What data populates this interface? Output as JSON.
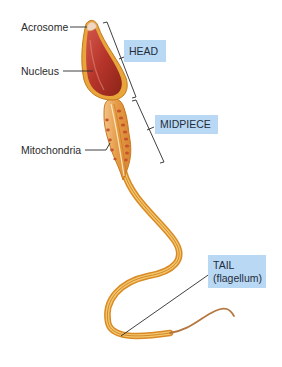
{
  "diagram": {
    "labels": {
      "acrosome": "Acrosome",
      "nucleus": "Nucleus",
      "mitochondria": "Mitochondria"
    },
    "regions": {
      "head": "HEAD",
      "midpiece": "MIDPIECE",
      "tail_line1": "TAIL",
      "tail_line2": "(flagellum)"
    },
    "colors": {
      "label_box": "#b9d8f3",
      "head_fill": "#b8352a",
      "membrane": "#e0a030",
      "midpiece_fill": "#e8a24a",
      "mitochondria": "#c85a28",
      "leader_line": "#2a2a2a"
    }
  }
}
